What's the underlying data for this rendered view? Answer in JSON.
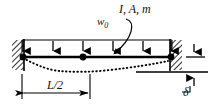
{
  "figure": {
    "type": "engineering-diagram",
    "width": 210,
    "height": 105,
    "background_color": "#ffffff",
    "line_color": "#000000"
  },
  "labels": {
    "beam_properties": "I, A, m",
    "distributed_load": "w",
    "distributed_load_subscript": "0",
    "half_span": "L/2",
    "settlement": "δ"
  },
  "elements": {
    "beam": {
      "name": "beam",
      "x_start": 22,
      "x_end": 172,
      "y": 57,
      "thickness": 2.4
    },
    "load_bar": {
      "name": "load-distribution-bar",
      "x_start": 22,
      "x_end": 172,
      "y": 40,
      "thickness": 1
    },
    "load_arrows": {
      "name": "distributed-load-arrows",
      "count": 6,
      "x_positions": [
        23,
        53,
        83,
        113,
        143,
        171
      ],
      "y_top": 40,
      "y_tip": 56,
      "direction": "down"
    },
    "left_support": {
      "name": "left-fixed-support",
      "type": "hatched-wall",
      "x": 12,
      "y": 40,
      "width": 12,
      "height": 30,
      "hatch_angle_deg": 45
    },
    "right_support": {
      "name": "right-fixed-support",
      "type": "hatched-wall",
      "x": 170,
      "y": 40,
      "width": 12,
      "height": 30,
      "hatch_angle_deg": 45
    },
    "support_nodes": {
      "name": "support-nodes",
      "x_positions": [
        23,
        83,
        171
      ],
      "y": 57,
      "radius": 3.4,
      "fill": "#000000"
    },
    "deflection_curve": {
      "name": "deflected-shape-curve",
      "style": "dotted",
      "points": [
        [
          23,
          58
        ],
        [
          40,
          66
        ],
        [
          58,
          70
        ],
        [
          83,
          72
        ],
        [
          110,
          70
        ],
        [
          140,
          66
        ],
        [
          168,
          61
        ]
      ]
    },
    "dimension_L2": {
      "name": "half-span-dimension",
      "x_start": 22,
      "x_end": 90,
      "y": 93,
      "ext_top": 74,
      "arrowheads": "both"
    },
    "dimension_delta": {
      "name": "settlement-dimension",
      "x": 194,
      "y_top": 45,
      "y_bottom": 85,
      "reference_line_y": 72,
      "reference_line_x_start": 136,
      "reference_line_x_end": 208,
      "beam_level_tick_y": 57,
      "arrowheads": "both-inward"
    },
    "load_leader": {
      "name": "load-label-leader-line",
      "from": [
        129,
        17
      ],
      "to": [
        114,
        56
      ],
      "style": "curved-arrow"
    }
  }
}
